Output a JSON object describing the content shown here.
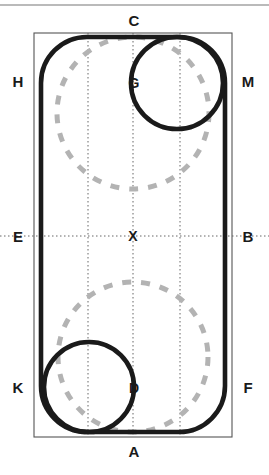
{
  "figure": {
    "canvas": {
      "width": 269,
      "height": 475
    },
    "colors": {
      "background": "#ffffff",
      "thick_stroke": "#1a1a1a",
      "thin_frame": "#555555",
      "dashed_circle": "#b3b3b3",
      "gridline": "#666666",
      "label_text": "#1a1a1a",
      "top_rule": "#777777"
    },
    "top_rule": {
      "y": 5,
      "x1": 0,
      "x2": 269
    },
    "outer_frame": {
      "x": 34,
      "y": 33,
      "width": 198,
      "height": 404,
      "stroke_width": 1
    },
    "rounded_rect": {
      "x": 41,
      "y": 37,
      "width": 184,
      "height": 395,
      "corner_radius": 46,
      "stroke_width": 4.6
    },
    "solid_circles": [
      {
        "name": "circle-G",
        "cx": 177,
        "cy": 83,
        "r": 46,
        "stroke_width": 4.6
      },
      {
        "name": "circle-D",
        "cx": 89,
        "cy": 387,
        "r": 45,
        "stroke_width": 4.6
      }
    ],
    "dashed_circles": [
      {
        "name": "dashed-circle-upper",
        "cx": 133,
        "cy": 113,
        "r": 76,
        "stroke_width": 5,
        "dash": "9 10"
      },
      {
        "name": "dashed-circle-lower",
        "cx": 133,
        "cy": 357,
        "r": 75,
        "stroke_width": 5,
        "dash": "9 10"
      }
    ],
    "gridlines": {
      "vertical_x": [
        88,
        133,
        180
      ],
      "horizontal_y": [
        236
      ],
      "stroke_width": 1,
      "dash": "1.5 2.5"
    }
  },
  "labels": [
    {
      "id": "C",
      "text": "C",
      "x": 133,
      "y": 21,
      "position": "top-center"
    },
    {
      "id": "H",
      "text": "H",
      "x": 18,
      "y": 82,
      "position": "left-upper"
    },
    {
      "id": "M",
      "text": "M",
      "x": 248,
      "y": 82,
      "position": "right-upper"
    },
    {
      "id": "G",
      "text": "G",
      "x": 134,
      "y": 83,
      "position": "interior-upper"
    },
    {
      "id": "E",
      "text": "E",
      "x": 18,
      "y": 237,
      "position": "left-middle"
    },
    {
      "id": "B",
      "text": "B",
      "x": 248,
      "y": 237,
      "position": "right-middle"
    },
    {
      "id": "X",
      "text": "X",
      "x": 133,
      "y": 237,
      "position": "center"
    },
    {
      "id": "K",
      "text": "K",
      "x": 18,
      "y": 388,
      "position": "left-lower"
    },
    {
      "id": "F",
      "text": "F",
      "x": 248,
      "y": 388,
      "position": "right-lower"
    },
    {
      "id": "D",
      "text": "D",
      "x": 134,
      "y": 388,
      "position": "interior-lower"
    },
    {
      "id": "A",
      "text": "A",
      "x": 133,
      "y": 452,
      "position": "bottom-center"
    }
  ]
}
